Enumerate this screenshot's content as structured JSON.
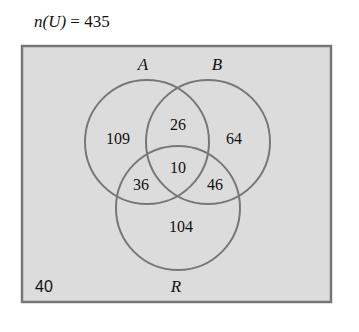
{
  "title": {
    "prefix": "n(U)",
    "equals": "=",
    "value": "435"
  },
  "universe": {
    "fill": "#dcdcdc",
    "border": "#777777"
  },
  "sets": {
    "A": {
      "label": "A"
    },
    "B": {
      "label": "B"
    },
    "R": {
      "label": "R"
    }
  },
  "regions": {
    "A_only": "109",
    "A_and_B_only": "26",
    "B_only": "64",
    "A_B_R": "10",
    "A_and_R_only": "36",
    "B_and_R_only": "46",
    "R_only": "104",
    "outside": "40"
  }
}
